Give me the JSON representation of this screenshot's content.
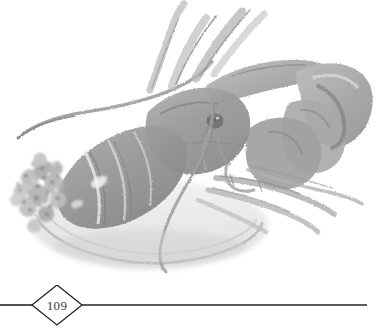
{
  "page": {
    "kind": "book-page-illustration",
    "background_color": "#ffffff",
    "width": 379,
    "height": 331
  },
  "illustration": {
    "title": "Watercolour lobster on a plate with herb garnish",
    "medium": "grayscale watercolour wash",
    "subject": "lobster",
    "accessories": [
      "plate",
      "herb garnish",
      "antennae",
      "claws",
      "legs",
      "tail"
    ],
    "ink_color": "#6a6a6a",
    "mid_tone": "#9b9b9b",
    "light_tone": "#c9c9c9",
    "pale_tone": "#e2e2e2",
    "paper_color": "#ffffff"
  },
  "footer": {
    "folio": "109",
    "rule_color": "#24242a",
    "diamond_stroke": "#24242a",
    "rule_start_x": 0,
    "rule_end_x": 367,
    "diamond_center_x": 57,
    "diamond_half_width": 25,
    "diamond_half_height": 20
  }
}
